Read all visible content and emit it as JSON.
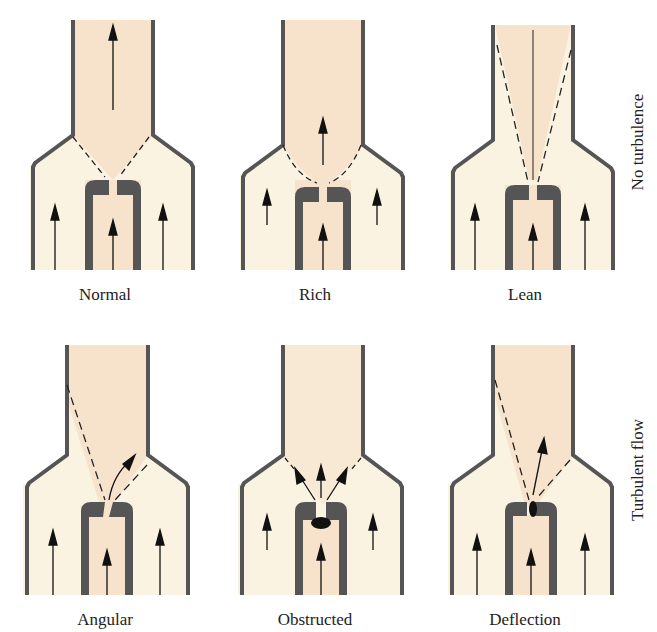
{
  "figure": {
    "rows": [
      {
        "label": "No turbulence",
        "panels": [
          {
            "id": "normal",
            "caption": "Normal"
          },
          {
            "id": "rich",
            "caption": "Rich"
          },
          {
            "id": "lean",
            "caption": "Lean"
          }
        ]
      },
      {
        "label": "Turbulent flow",
        "panels": [
          {
            "id": "angular",
            "caption": "Angular"
          },
          {
            "id": "obstructed",
            "caption": "Obstructed"
          },
          {
            "id": "deflection",
            "caption": "Deflection"
          }
        ]
      }
    ],
    "colors": {
      "flame_fill": "#f7e3cc",
      "air_fill": "#fbf3e2",
      "wall": "#5a5a5a",
      "arrow": "#111111"
    }
  }
}
